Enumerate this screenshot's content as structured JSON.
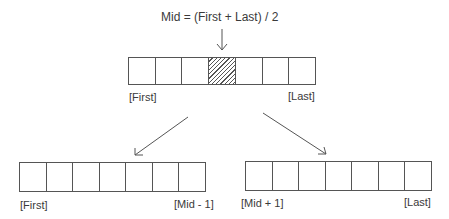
{
  "formula": "Mid = (First + Last) / 2",
  "top_array": {
    "cells": 7,
    "highlighted_index": 3,
    "left_label": "[First]",
    "right_label": "[Last]"
  },
  "left_array": {
    "cells": 7,
    "left_label": "[First]",
    "right_label": "[Mid - 1]"
  },
  "right_array": {
    "cells": 7,
    "left_label": "[Mid + 1]",
    "right_label": "[Last]"
  },
  "colors": {
    "line": "#555555",
    "text": "#3a3a3a",
    "background": "#ffffff"
  }
}
